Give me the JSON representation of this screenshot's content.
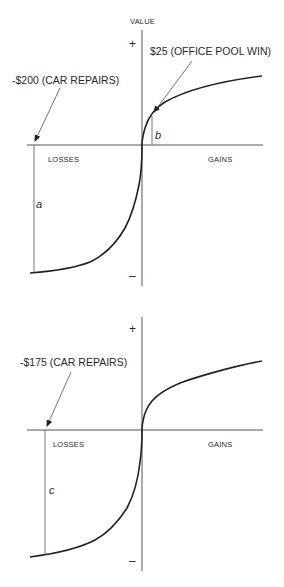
{
  "diagram": {
    "type": "prospect-theory-value-function",
    "panels": [
      {
        "id": "top",
        "y_axis_label": "VALUE",
        "plus_label": "+",
        "minus_label": "–",
        "losses_label": "LOSSES",
        "gains_label": "GAINS",
        "loss_annotation": "-$200 (CAR REPAIRS)",
        "gain_annotation": "$25 (OFFICE POOL WIN)",
        "loss_segment_label": "a",
        "gain_segment_label": "b"
      },
      {
        "id": "bottom",
        "plus_label": "+",
        "minus_label": "–",
        "losses_label": "LOSSES",
        "gains_label": "GAINS",
        "loss_annotation": "-$175 (CAR REPAIRS)",
        "loss_segment_label": "c"
      }
    ]
  },
  "colors": {
    "background": "#ffffff",
    "line": "#222222",
    "text": "#2a2a2a"
  }
}
